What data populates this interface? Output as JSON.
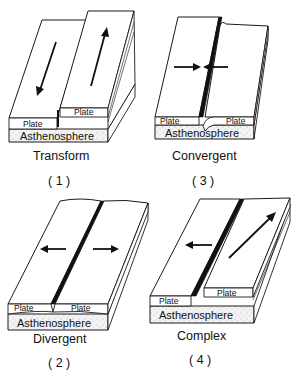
{
  "diagram": {
    "panels": [
      {
        "id": "1",
        "name": "Transform",
        "number_label": "( 1 )",
        "layer_labels": {
          "left_plate": "Plate",
          "right_plate": "Plate",
          "mantle": "Asthenosphere"
        },
        "motion": "plates slide past each other in opposite directions (left down, right up)"
      },
      {
        "id": "2",
        "name": "Divergent",
        "number_label": "( 2 )",
        "layer_labels": {
          "left_plate": "Plate",
          "right_plate": "Plate",
          "mantle": "Asthenosphere"
        },
        "motion": "plates move apart (arrows point outward)"
      },
      {
        "id": "3",
        "name": "Convergent",
        "number_label": "( 3 )",
        "layer_labels": {
          "left_plate": "Plate",
          "right_plate": "Plate",
          "mantle": "Asthenosphere"
        },
        "motion": "plates move toward each other (arrows point inward), right plate subducts"
      },
      {
        "id": "4",
        "name": "Complex",
        "number_label": "( 4 )",
        "layer_labels": {
          "left_plate": "Plate",
          "right_plate": "Plate",
          "mantle": "Asthenosphere"
        },
        "motion": "left plate moves left, right plate moves diagonally up-right"
      }
    ],
    "colors": {
      "ink": "#111111",
      "paper": "#ffffff"
    }
  }
}
